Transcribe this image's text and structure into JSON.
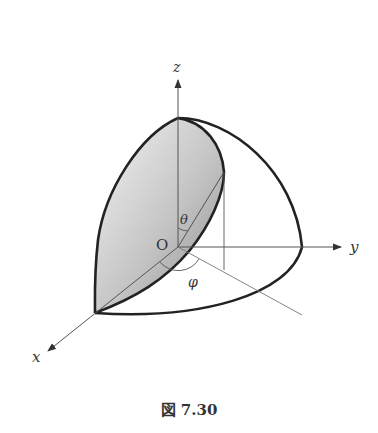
{
  "figure": {
    "caption": "図 7.30",
    "axes": {
      "x_label": "x",
      "y_label": "y",
      "z_label": "z"
    },
    "origin_label": "O",
    "angle_labels": {
      "polar": "θ",
      "azimuth": "φ"
    },
    "colors": {
      "stroke": "#222222",
      "axis": "#555555",
      "shade_light": "#f0f0f0",
      "shade_dark": "#9a9a9a"
    }
  }
}
